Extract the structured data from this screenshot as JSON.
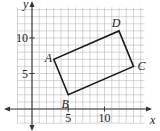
{
  "diagram": {
    "type": "coordinate-grid-polygon",
    "axes": {
      "x_label": "x",
      "y_label": "y",
      "x_range": [
        -2,
        15
      ],
      "y_range": [
        -2,
        14
      ],
      "x_ticks": [
        {
          "value": 5,
          "label": "5"
        },
        {
          "value": 10,
          "label": "10"
        }
      ],
      "y_ticks": [
        {
          "value": 5,
          "label": "5"
        },
        {
          "value": 10,
          "label": "10"
        }
      ],
      "grid": true
    },
    "polygon": {
      "shape": "rectangle",
      "vertices": [
        {
          "name": "A",
          "x": 3,
          "y": 7
        },
        {
          "name": "B",
          "x": 5,
          "y": 2
        },
        {
          "name": "C",
          "x": 14,
          "y": 6
        },
        {
          "name": "D",
          "x": 12,
          "y": 11
        }
      ]
    },
    "colors": {
      "grid": "#b8b8b8",
      "axes": "#333333",
      "polygon": "#1a1a1a",
      "background": "#ffffff"
    }
  }
}
